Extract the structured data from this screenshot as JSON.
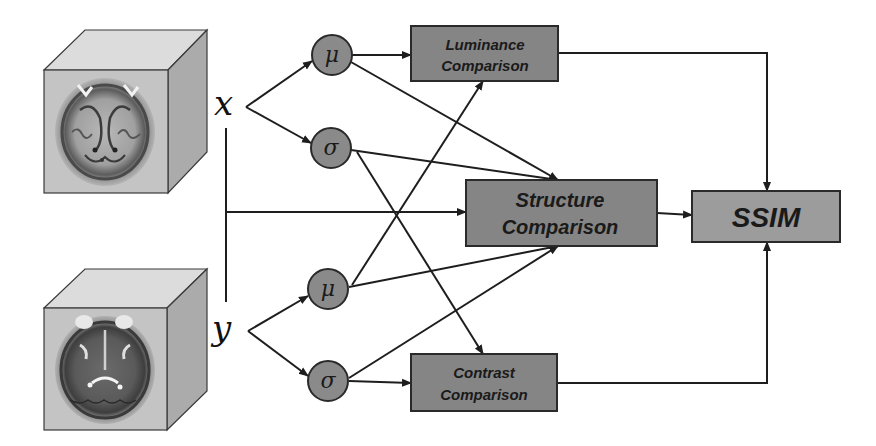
{
  "diagram": {
    "colors": {
      "comparison_box_fill": "#858585",
      "ssim_box_fill": "#9c9c9c",
      "stat_node_fill": "#8a8a8a",
      "stroke": "#1e1e1e",
      "cube_front": "#c8c8c8",
      "cube_top": "#dedede",
      "cube_side": "#b0b0b0"
    },
    "inputs": [
      {
        "id": "x",
        "label": "x",
        "image": "brain-mri-axial-slice-1"
      },
      {
        "id": "y",
        "label": "y",
        "image": "brain-mri-axial-slice-2"
      }
    ],
    "stat_nodes": [
      {
        "id": "mu_x",
        "symbol": "μ",
        "meaning": "mean of x"
      },
      {
        "id": "sigma_x",
        "symbol": "σ",
        "meaning": "std of x"
      },
      {
        "id": "mu_y",
        "symbol": "μ",
        "meaning": "mean of y"
      },
      {
        "id": "sigma_y",
        "symbol": "σ",
        "meaning": "std of y"
      }
    ],
    "boxes": {
      "luminance": {
        "line1": "Luminance",
        "line2": "Comparison"
      },
      "structure": {
        "line1": "Structure",
        "line2": "Comparison"
      },
      "contrast": {
        "line1": "Contrast",
        "line2": "Comparison"
      },
      "ssim": {
        "label": "SSIM"
      }
    },
    "edges": [
      {
        "from": "x",
        "to": "mu_x"
      },
      {
        "from": "x",
        "to": "sigma_x"
      },
      {
        "from": "y",
        "to": "mu_y"
      },
      {
        "from": "y",
        "to": "sigma_y"
      },
      {
        "from": "mu_x",
        "to": "luminance"
      },
      {
        "from": "mu_y",
        "to": "luminance"
      },
      {
        "from": "sigma_x",
        "to": "contrast"
      },
      {
        "from": "sigma_y",
        "to": "contrast"
      },
      {
        "from": "mu_x",
        "to": "structure"
      },
      {
        "from": "sigma_x",
        "to": "structure"
      },
      {
        "from": "mu_y",
        "to": "structure"
      },
      {
        "from": "sigma_y",
        "to": "structure"
      },
      {
        "from": "x,y",
        "to": "structure"
      },
      {
        "from": "luminance",
        "to": "ssim"
      },
      {
        "from": "structure",
        "to": "ssim"
      },
      {
        "from": "contrast",
        "to": "ssim"
      }
    ]
  }
}
